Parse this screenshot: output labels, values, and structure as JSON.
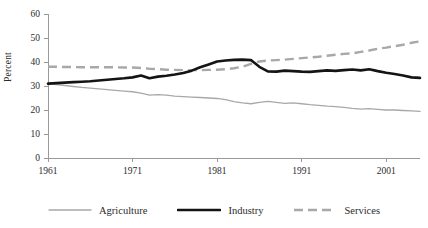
{
  "chart_data": {
    "type": "line",
    "title": "",
    "xlabel": "",
    "ylabel": "Percent",
    "ylim": [
      0,
      60
    ],
    "xlim": [
      1961,
      2005
    ],
    "ytick_labels": [
      "0",
      "10",
      "20",
      "30",
      "40",
      "50",
      "60"
    ],
    "yticks": [
      0,
      10,
      20,
      30,
      40,
      50,
      60
    ],
    "xtick_labels": [
      "1961",
      "1971",
      "1981",
      "1991",
      "2001"
    ],
    "xticks": [
      1961,
      1971,
      1981,
      1991,
      2001
    ],
    "grid": false,
    "legend_position": "bottom",
    "x": [
      1961,
      1962,
      1963,
      1964,
      1965,
      1966,
      1967,
      1968,
      1969,
      1970,
      1971,
      1972,
      1973,
      1974,
      1975,
      1976,
      1977,
      1978,
      1979,
      1980,
      1981,
      1982,
      1983,
      1984,
      1985,
      1986,
      1987,
      1988,
      1989,
      1990,
      1991,
      1992,
      1993,
      1994,
      1995,
      1996,
      1997,
      1998,
      1999,
      2000,
      2001,
      2002,
      2003,
      2004,
      2005
    ],
    "series": [
      {
        "name": "Agriculture",
        "style": "solid-thin-gray",
        "color": "#a8a8a8",
        "values": [
          31.0,
          30.6,
          30.2,
          29.8,
          29.4,
          29.1,
          28.8,
          28.5,
          28.2,
          27.9,
          27.6,
          27.0,
          26.2,
          26.4,
          26.2,
          25.8,
          25.6,
          25.4,
          25.2,
          25.0,
          24.8,
          24.3,
          23.5,
          23.0,
          22.6,
          23.2,
          23.6,
          23.2,
          22.8,
          23.0,
          22.6,
          22.2,
          21.9,
          21.6,
          21.4,
          21.1,
          20.7,
          20.4,
          20.6,
          20.3,
          20.0,
          20.0,
          19.8,
          19.6,
          19.4
        ]
      },
      {
        "name": "Industry",
        "style": "solid-thick-black",
        "color": "#141414",
        "values": [
          31.0,
          31.2,
          31.4,
          31.6,
          31.8,
          32.0,
          32.3,
          32.6,
          32.9,
          33.2,
          33.6,
          34.4,
          33.2,
          33.9,
          34.3,
          34.8,
          35.4,
          36.4,
          37.8,
          39.0,
          40.2,
          40.6,
          40.9,
          41.0,
          40.8,
          38.0,
          36.1,
          36.0,
          36.4,
          36.2,
          36.0,
          35.9,
          36.2,
          36.5,
          36.3,
          36.6,
          36.9,
          36.5,
          37.0,
          36.2,
          35.5,
          35.0,
          34.4,
          33.6,
          33.4
        ]
      },
      {
        "name": "Services",
        "style": "dashed-gray",
        "color": "#a8a8a8",
        "values": [
          38.0,
          38.0,
          37.9,
          37.9,
          37.8,
          37.8,
          37.8,
          37.8,
          37.8,
          37.7,
          37.7,
          37.5,
          37.2,
          37.0,
          36.8,
          36.7,
          36.6,
          36.6,
          36.6,
          36.7,
          36.8,
          37.0,
          37.4,
          38.0,
          39.2,
          40.2,
          40.6,
          40.8,
          41.0,
          41.3,
          41.6,
          41.9,
          42.2,
          42.6,
          43.0,
          43.4,
          43.6,
          44.2,
          44.8,
          45.5,
          46.0,
          46.6,
          47.2,
          48.0,
          48.6
        ]
      }
    ]
  },
  "legend": {
    "items": [
      {
        "label": "Agriculture",
        "swatch": "thin-gray-line"
      },
      {
        "label": "Industry",
        "swatch": "thick-black-line"
      },
      {
        "label": "Services",
        "swatch": "gray-dashed-line"
      }
    ]
  }
}
